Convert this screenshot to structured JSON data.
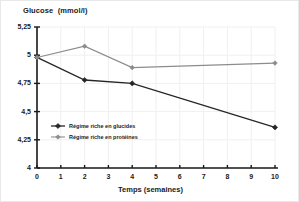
{
  "chart_data": {
    "type": "line",
    "title": "Glucose  (mmol/l)",
    "xlabel": "Temps (semaines)",
    "ylabel": "Glucose  (mmol/l)",
    "x": [
      0,
      2,
      4,
      10
    ],
    "xlim": [
      0,
      10
    ],
    "ylim": [
      4,
      5.25
    ],
    "xticks": [
      "0",
      "1",
      "2",
      "3",
      "4",
      "5",
      "6",
      "7",
      "8",
      "9",
      "10"
    ],
    "xtick_values": [
      0,
      1,
      2,
      3,
      4,
      5,
      6,
      7,
      8,
      9,
      10
    ],
    "yticks": [
      "4",
      "4,25",
      "4,5",
      "4,75",
      "5",
      "5,25"
    ],
    "ytick_values": [
      4,
      4.25,
      4.5,
      4.75,
      5,
      5.25
    ],
    "grid": true,
    "legend_position": "inside-lower-left",
    "series": [
      {
        "name": "Régime riche en glucides",
        "color": "#262626",
        "marker": "diamond",
        "values": [
          4.98,
          4.78,
          4.75,
          4.36
        ]
      },
      {
        "name": "Régime riche en protéines",
        "color": "#8c8c8c",
        "marker": "diamond",
        "values": [
          4.98,
          5.08,
          4.89,
          4.93
        ]
      }
    ]
  },
  "legend": {
    "items": [
      {
        "label": "Régime riche en glucides",
        "color": "#262626"
      },
      {
        "label": "Régime riche en protéines",
        "color": "#8c8c8c"
      }
    ]
  },
  "colors": {
    "axis": "#1a1a1a",
    "grid": "#f0f0f0",
    "series_dark": "#262626",
    "series_grey": "#8c8c8c",
    "background": "#ffffff"
  }
}
